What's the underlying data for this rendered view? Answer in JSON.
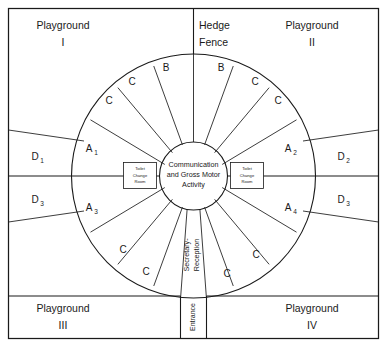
{
  "diagram": {
    "center": {
      "label_line1": "Communication",
      "label_line2": "and Gross Motor",
      "label_line3": "Activity"
    },
    "service_rooms": [
      {
        "name": "toilet-change-room-left",
        "line1": "Toilet",
        "line2": "Change",
        "line3": "Room"
      },
      {
        "name": "toilet-change-room-right",
        "line1": "Toilet",
        "line2": "Change",
        "line3": "Room"
      }
    ],
    "outer_quadrants": [
      {
        "name": "playground-1",
        "line1": "Playground",
        "line2": "I"
      },
      {
        "name": "playground-2",
        "line1": "Playground",
        "line2": "II"
      },
      {
        "name": "playground-3",
        "line1": "Playground",
        "line2": "III"
      },
      {
        "name": "playground-4",
        "line1": "Playground",
        "line2": "IV"
      }
    ],
    "hedge_fence": {
      "line1": "Hedge",
      "line2": "Fence"
    },
    "entrance": {
      "label": "Entrance"
    },
    "reception": {
      "line1": "Secretary-",
      "line2": "Reception"
    },
    "a_rooms": [
      {
        "name": "room-a1",
        "letter": "A",
        "sub": "1"
      },
      {
        "name": "room-a2",
        "letter": "A",
        "sub": "2"
      },
      {
        "name": "room-a3",
        "letter": "A",
        "sub": "3"
      },
      {
        "name": "room-a4",
        "letter": "A",
        "sub": "4"
      }
    ],
    "d_areas": [
      {
        "name": "area-d1",
        "letter": "D",
        "sub": "1"
      },
      {
        "name": "area-d2",
        "letter": "D",
        "sub": "2"
      },
      {
        "name": "area-d3-left",
        "letter": "D",
        "sub": "3"
      },
      {
        "name": "area-d3-right",
        "letter": "D",
        "sub": "3"
      }
    ],
    "wedge_rooms_top": [
      {
        "name": "room-c-tl-outer",
        "label": "C"
      },
      {
        "name": "room-c-tl-inner",
        "label": "C"
      },
      {
        "name": "room-b-tl",
        "label": "B"
      },
      {
        "name": "room-b-tr",
        "label": "B"
      },
      {
        "name": "room-c-tr-inner",
        "label": "C"
      },
      {
        "name": "room-c-tr-outer",
        "label": "C"
      }
    ],
    "wedge_rooms_bottom": [
      {
        "name": "room-c-bl-outer",
        "label": "C"
      },
      {
        "name": "room-c-bl-inner",
        "label": "C"
      },
      {
        "name": "room-c-br-inner",
        "label": "C"
      },
      {
        "name": "room-c-br-outer",
        "label": "C"
      }
    ],
    "colors": {
      "ink": "#1a1a1a",
      "paper": "#ffffff"
    }
  }
}
